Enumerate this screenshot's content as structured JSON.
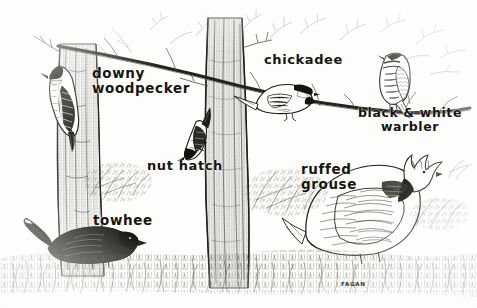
{
  "artwork": {
    "title": "Woodland Birds",
    "medium": "pen-and-ink illustration",
    "signature": "FAGAN",
    "background_color": "#fdfdfb",
    "ink_color": "#16150f",
    "width": 477,
    "height": 308
  },
  "labels": {
    "downy_woodpecker": "downy\nwoodpecker",
    "chickadee": "chickadee",
    "black_and_white_warbler": "black & white\nwarbler",
    "nuthatch": "nut hatch",
    "ruffed_grouse": "ruffed\ngrouse",
    "towhee": "towhee"
  },
  "birds": [
    {
      "name": "downy woodpecker",
      "label": "downy woodpecker",
      "perch": "left tree trunk",
      "pose": "clinging vertically, head up"
    },
    {
      "name": "chickadee",
      "label": "chickadee",
      "perch": "diagonal branch",
      "pose": "perched facing right"
    },
    {
      "name": "black & white warbler",
      "label": "black & white warbler",
      "perch": "diagonal branch",
      "pose": "perched upright facing left"
    },
    {
      "name": "nuthatch",
      "label": "nut hatch",
      "perch": "center tree trunk",
      "pose": "clinging head-down"
    },
    {
      "name": "ruffed grouse",
      "label": "ruffed grouse",
      "perch": "ground",
      "pose": "standing in grass, crest raised"
    },
    {
      "name": "towhee",
      "label": "towhee",
      "perch": "ground",
      "pose": "standing in low brush facing right"
    }
  ],
  "scene": {
    "elements": [
      "left tree trunk",
      "center tree trunk",
      "diagonal branch",
      "bare twigs",
      "ground grass",
      "shrubs"
    ]
  }
}
